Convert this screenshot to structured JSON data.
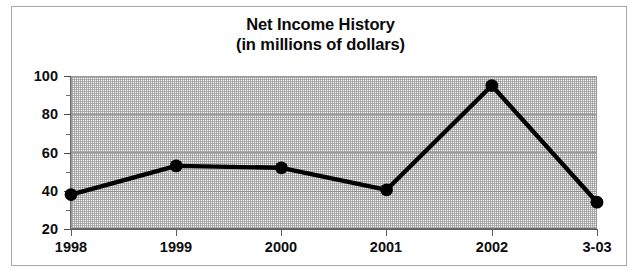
{
  "chart_data": {
    "type": "line",
    "title": "Net Income History",
    "subtitle": "(in millions of dollars)",
    "xlabel": "",
    "ylabel": "",
    "categories": [
      "1998",
      "1999",
      "2000",
      "2001",
      "2002",
      "3-03"
    ],
    "values": [
      38,
      53,
      52,
      40.5,
      95,
      34
    ],
    "series": [
      {
        "name": "Net Income",
        "values": [
          38,
          53,
          52,
          40.5,
          95,
          34
        ]
      }
    ],
    "ylim": [
      20,
      100
    ],
    "ytick_labels": [
      "20",
      "40",
      "60",
      "80",
      "100"
    ],
    "ytick_values": [
      20,
      40,
      60,
      80,
      100
    ],
    "yminor_tick_values": [
      30,
      50,
      70,
      90
    ],
    "grid": true,
    "grid_axis": "y",
    "legend": false,
    "legend_position": "none",
    "line_color": "#000000",
    "marker_color": "#000000",
    "marker_shape": "circle",
    "plot_background": "#f2f2f2",
    "frame_color": "#a8a8a8",
    "text_color": "#0d0d0d"
  },
  "axes": {
    "y_labels": [
      {
        "text": "100",
        "value": 100
      },
      {
        "text": "80",
        "value": 80
      },
      {
        "text": "60",
        "value": 60
      },
      {
        "text": "40",
        "value": 40
      },
      {
        "text": "20",
        "value": 20
      }
    ],
    "x_labels": [
      {
        "text": "1998",
        "value": 38
      },
      {
        "text": "1999",
        "value": 53
      },
      {
        "text": "2000",
        "value": 52
      },
      {
        "text": "2001",
        "value": 40.5
      },
      {
        "text": "2002",
        "value": 95
      },
      {
        "text": "3-03",
        "value": 34
      }
    ]
  }
}
